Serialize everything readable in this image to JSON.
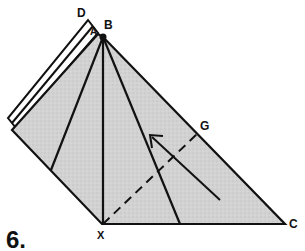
{
  "figure": {
    "step_number": "6.",
    "labels": {
      "D": "D",
      "A": "A",
      "B": "B",
      "G": "G",
      "X": "X",
      "C": "C"
    },
    "colors": {
      "fill": "#cfcfcf",
      "stroke": "#111111",
      "background": "#ffffff"
    }
  }
}
